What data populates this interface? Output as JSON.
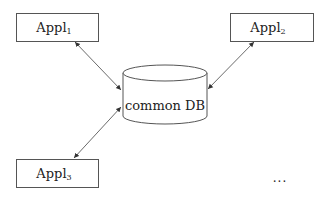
{
  "diagram": {
    "title": "",
    "colors": {
      "stroke": "#555555",
      "text": "#222222",
      "background": "#ffffff"
    },
    "nodes": [
      {
        "id": "appl1",
        "shape": "rectangle",
        "label": "Appl",
        "subscript": "1",
        "x": 16,
        "y": 13,
        "w": 82,
        "h": 28
      },
      {
        "id": "appl2",
        "shape": "rectangle",
        "label": "Appl",
        "subscript": "2",
        "x": 230,
        "y": 13,
        "w": 83,
        "h": 28
      },
      {
        "id": "appl3",
        "shape": "rectangle",
        "label": "Appl",
        "subscript": "3",
        "x": 16,
        "y": 159,
        "w": 82,
        "h": 28
      },
      {
        "id": "db",
        "shape": "cylinder",
        "label": "common DB",
        "cx": 165,
        "rx": 42,
        "top_cy": 73,
        "bottom_cy": 116,
        "ry": 8
      }
    ],
    "edges": [
      {
        "from": "appl1",
        "to": "db",
        "direction": "bidirectional"
      },
      {
        "from": "appl2",
        "to": "db",
        "direction": "bidirectional"
      },
      {
        "from": "appl3",
        "to": "db",
        "direction": "bidirectional"
      }
    ],
    "annotations": [
      {
        "id": "ellipsis",
        "text": "..."
      }
    ]
  }
}
